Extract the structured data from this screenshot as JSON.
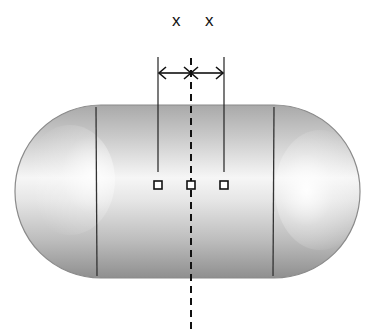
{
  "figure": {
    "dimension_labels": [
      "x",
      "x"
    ],
    "shape": "capsule-tank",
    "centerline": "dashed-vertical-axis",
    "sensor_markers": 3,
    "colors": {
      "stroke": "#222222",
      "tank_dark": "#8f8f8f",
      "tank_mid": "#c8c8c8",
      "tank_light": "#f4f4f4",
      "background": "#ffffff"
    }
  }
}
